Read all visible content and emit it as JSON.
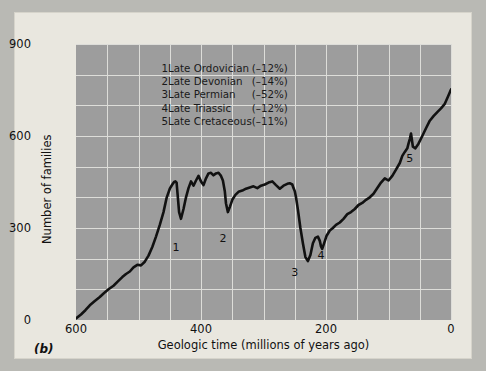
{
  "panel_label": "(b)",
  "legend": {
    "entries": [
      {
        "n": "1",
        "name": "Late Ordovician",
        "pct": "(–12%)"
      },
      {
        "n": "2",
        "name": "Late Devonian",
        "pct": "(–14%)"
      },
      {
        "n": "3",
        "name": "Late Permian",
        "pct": "(–52%)"
      },
      {
        "n": "4",
        "name": "Late Triassic",
        "pct": "(–12%)"
      },
      {
        "n": "5",
        "name": "Late Cretaceous",
        "pct": "(–11%)"
      }
    ]
  },
  "colors": {
    "plot_background": "#9d9d9d",
    "figure_background": "#e9e7df",
    "outer_background": "#b9b9b4",
    "gridline": "#ddddd9",
    "curve": "#111111"
  },
  "chart_data": {
    "type": "line",
    "title": "",
    "xlabel": "Geologic time (millions of years ago)",
    "ylabel": "Number of families",
    "xlim": [
      600,
      0
    ],
    "ylim": [
      0,
      900
    ],
    "x_ticks": [
      600,
      400,
      200,
      0
    ],
    "y_ticks": [
      0,
      300,
      600,
      900
    ],
    "x_gridline_step": 50,
    "y_gridline_step": 100,
    "x_axis_reversed": true,
    "grid": true,
    "legend_position": "top-left",
    "annotations": [
      {
        "label": "1",
        "x": 440,
        "y": 270,
        "event": "Late Ordovician"
      },
      {
        "label": "2",
        "x": 365,
        "y": 300,
        "event": "Late Devonian"
      },
      {
        "label": "3",
        "x": 250,
        "y": 190,
        "event": "Late Permian"
      },
      {
        "label": "4",
        "x": 208,
        "y": 245,
        "event": "Late Triassic"
      },
      {
        "label": "5",
        "x": 66,
        "y": 560,
        "event": "Late Cretaceous"
      }
    ],
    "series": [
      {
        "name": "Marine family diversity",
        "x": [
          600,
          592,
          585,
          578,
          570,
          562,
          555,
          548,
          540,
          533,
          526,
          520,
          514,
          508,
          502,
          496,
          490,
          484,
          478,
          472,
          466,
          460,
          455,
          450,
          446,
          443,
          441,
          439,
          437,
          435,
          432,
          428,
          424,
          420,
          416,
          412,
          408,
          404,
          400,
          396,
          392,
          388,
          384,
          380,
          376,
          372,
          368,
          365,
          362,
          360,
          357,
          354,
          350,
          345,
          340,
          334,
          328,
          322,
          316,
          310,
          304,
          298,
          292,
          286,
          280,
          274,
          268,
          262,
          258,
          254,
          252,
          250,
          248,
          245,
          241,
          237,
          233,
          229,
          225,
          221,
          217,
          213,
          210,
          208,
          206,
          203,
          199,
          194,
          189,
          184,
          178,
          172,
          166,
          160,
          154,
          148,
          142,
          136,
          130,
          124,
          118,
          112,
          106,
          100,
          94,
          88,
          82,
          78,
          74,
          70,
          68,
          66,
          64,
          61,
          57,
          52,
          46,
          40,
          34,
          28,
          22,
          16,
          10,
          5,
          0
        ],
        "y": [
          5,
          18,
          32,
          48,
          62,
          75,
          88,
          100,
          112,
          126,
          140,
          150,
          158,
          172,
          180,
          178,
          190,
          210,
          238,
          272,
          310,
          352,
          398,
          428,
          442,
          450,
          452,
          448,
          398,
          352,
          330,
          362,
          400,
          430,
          452,
          438,
          455,
          470,
          452,
          440,
          462,
          478,
          480,
          472,
          478,
          480,
          470,
          455,
          420,
          380,
          352,
          368,
          392,
          408,
          418,
          422,
          428,
          432,
          436,
          430,
          438,
          442,
          448,
          452,
          440,
          428,
          438,
          444,
          446,
          442,
          430,
          420,
          400,
          360,
          300,
          250,
          205,
          192,
          212,
          250,
          268,
          272,
          258,
          240,
          232,
          250,
          275,
          292,
          300,
          310,
          318,
          330,
          345,
          352,
          362,
          375,
          382,
          392,
          400,
          412,
          430,
          448,
          462,
          455,
          470,
          490,
          512,
          535,
          548,
          560,
          575,
          590,
          608,
          565,
          560,
          575,
          600,
          625,
          650,
          665,
          678,
          690,
          705,
          728,
          752
        ]
      }
    ]
  }
}
